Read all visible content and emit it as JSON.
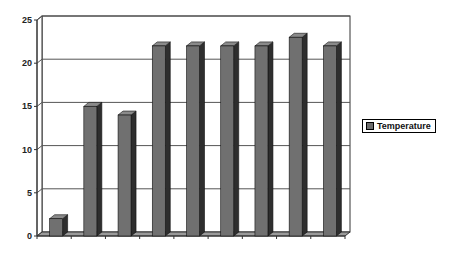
{
  "chart_data": {
    "type": "bar",
    "style": "3d-column",
    "title": "",
    "xlabel": "",
    "ylabel": "",
    "categories": [
      "1",
      "2",
      "3",
      "4",
      "5",
      "6",
      "7",
      "8",
      "9"
    ],
    "series": [
      {
        "name": "Temperature",
        "values": [
          2,
          15,
          14,
          22,
          22,
          22,
          22,
          23,
          22
        ]
      }
    ],
    "ylim": [
      0,
      25
    ],
    "yticks": [
      0,
      5,
      10,
      15,
      20,
      25
    ],
    "xtick_labels_visible": false,
    "grid": true,
    "legend_position": "right"
  },
  "colors": {
    "bar_front": "#707070",
    "bar_side": "#2e2e2e",
    "bar_top": "#8a8a8a",
    "grid": "#555555",
    "axis": "#333333"
  },
  "legend": {
    "label": "Temperature"
  }
}
